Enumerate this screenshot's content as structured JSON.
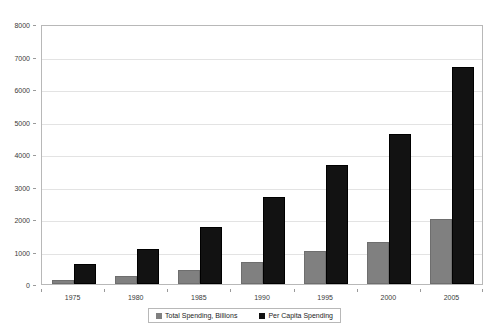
{
  "chart_data": {
    "type": "bar",
    "title": "",
    "xlabel": "",
    "ylabel": "",
    "categories": [
      "1975",
      "1980",
      "1985",
      "1990",
      "1995",
      "2000",
      "2005"
    ],
    "series": [
      {
        "name": "Total Spending, Billions",
        "color": "#808080",
        "values": [
          130,
          250,
          430,
          690,
          1020,
          1300,
          2000
        ]
      },
      {
        "name": "Per Capita Spending",
        "color": "#121212",
        "values": [
          630,
          1080,
          1760,
          2680,
          3650,
          4620,
          6680
        ]
      }
    ],
    "ylim": [
      0,
      8000
    ],
    "ytick_labels": [
      "0",
      "1000",
      "2000",
      "3000",
      "4000",
      "5000",
      "6000",
      "7000",
      "8000"
    ],
    "ytick_values": [
      0,
      1000,
      2000,
      3000,
      4000,
      5000,
      6000,
      7000,
      8000
    ],
    "grid": true,
    "legend_position": "bottom"
  },
  "legend": {
    "entries": [
      {
        "label": "Total Spending, Billions",
        "swatch": "gray-swatch-icon"
      },
      {
        "label": "Per Capita Spending",
        "swatch": "black-swatch-icon"
      }
    ]
  }
}
